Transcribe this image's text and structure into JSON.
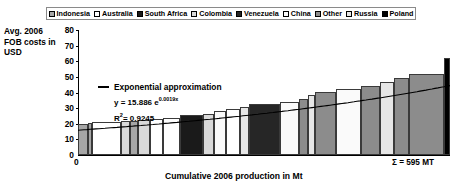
{
  "legend": {
    "items": [
      {
        "label": "Indonesia",
        "color": "#a6a6a6"
      },
      {
        "label": "Australia",
        "color": "#ffffff"
      },
      {
        "label": "South Africa",
        "color": "#1a1a1a"
      },
      {
        "label": "Colombia",
        "color": "#d9d9d9"
      },
      {
        "label": "Venezuela",
        "color": "#262626"
      },
      {
        "label": "China",
        "color": "#fafafa"
      },
      {
        "label": "Other",
        "color": "#8c8c8c"
      },
      {
        "label": "Russia",
        "color": "#e6e6e6"
      },
      {
        "label": "Poland",
        "color": "#000000"
      }
    ]
  },
  "axes": {
    "y_title": "Avg. 2006 FOB costs in USD",
    "y_ticks": [
      "80",
      "70",
      "60",
      "50",
      "40",
      "30",
      "20",
      "10",
      "0"
    ],
    "x_title": "Cumulative 2006 production in Mt",
    "x_origin": "0",
    "total_label": "Σ = 595 MT"
  },
  "annotation": {
    "trend_label": "Exponential approximation",
    "equation_prefix": "y  = 15.886 e",
    "equation_exponent": "0.0019x",
    "r2_label": "R",
    "r2_sup": "2",
    "r2_value": "= 0.9245"
  },
  "chart_data": {
    "type": "bar",
    "title": "",
    "subtitle": "",
    "xlabel": "Cumulative 2006 production in Mt",
    "ylabel": "Avg. 2006 FOB costs in USD",
    "xlim": [
      0,
      595
    ],
    "ylim": [
      0,
      80
    ],
    "grid": false,
    "legend_position": "top",
    "note": "Cost curve: bar width = 2006 production (Mt), bar height = average 2006 FOB cost (USD/t). Bars sorted ascending by cost; x axis is cumulative production.",
    "total_production_mt": 595,
    "categories": [
      "Indonesia",
      "Indonesia",
      "Australia",
      "Colombia",
      "Indonesia",
      "Colombia",
      "Australia",
      "Australia",
      "South Africa",
      "Colombia",
      "China",
      "Australia",
      "Russia",
      "Venezuela",
      "China",
      "Other",
      "Russia",
      "Other",
      "China",
      "Other",
      "Russia",
      "Other",
      "Other",
      "Poland"
    ],
    "values": [
      20.0,
      20.5,
      21.0,
      21.5,
      22.0,
      22.5,
      23.0,
      24.0,
      25.5,
      26.5,
      28.0,
      29.5,
      31.0,
      32.5,
      34.0,
      36.0,
      38.5,
      40.5,
      42.0,
      44.0,
      46.5,
      49.0,
      52.0,
      62.0
    ],
    "widths_mt": [
      14,
      6,
      42,
      13,
      12,
      17,
      20,
      24,
      34,
      16,
      17,
      20,
      13,
      46,
      27,
      14,
      10,
      30,
      36,
      28,
      20,
      23,
      50,
      9
    ],
    "cumulative_mt": [
      14,
      20,
      62,
      75,
      87,
      104,
      124,
      148,
      182,
      198,
      215,
      235,
      248,
      294,
      321,
      335,
      345,
      375,
      411,
      439,
      459,
      482,
      532,
      541
    ],
    "series": [
      {
        "name": "Exponential approximation",
        "type": "line",
        "equation": "y = 15.886 * exp(0.0019 * x)",
        "coefficient": 15.886,
        "rate": 0.0019,
        "r_squared": 0.9245
      }
    ]
  }
}
